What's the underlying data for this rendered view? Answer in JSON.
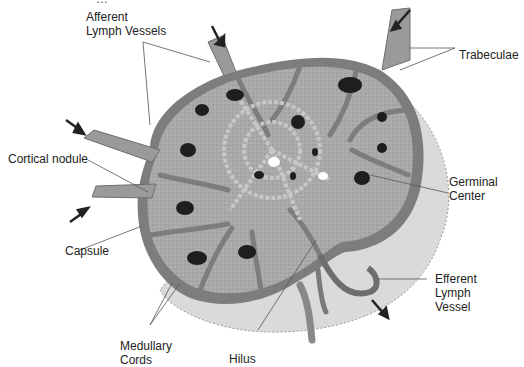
{
  "diagram": {
    "top_cut_text": "…",
    "labels": {
      "afferent": "Afferent\nLymph Vessels",
      "trabeculae": "Trabeculae",
      "cortical_nodule": "Cortical nodule",
      "germinal_center": "Germinal\nCenter",
      "capsule": "Capsule",
      "efferent": "Efferent\nLymph\nVessel",
      "medullary_cords": "Medullary\nCords",
      "hilus": "Hilus"
    },
    "colors": {
      "background": "#ffffff",
      "capsule_trabeculae": "#7d7d7d",
      "cortex": "#a9a9a9",
      "medulla_backdrop": "#dadada",
      "germinal_center": "#1e1e1e",
      "arrow": "#222222",
      "leader_line": "#555555"
    }
  }
}
